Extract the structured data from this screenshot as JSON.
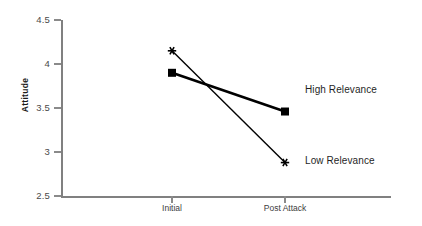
{
  "chart_data": {
    "type": "line",
    "title": "",
    "subtitle": "",
    "xlabel": "",
    "ylabel": "Attitude",
    "categories": [
      "Initial",
      "Post Attack"
    ],
    "ylim": [
      2.5,
      4.5
    ],
    "y_ticks": [
      2.5,
      3,
      3.5,
      4,
      4.5
    ],
    "y_tick_labels": [
      "2.5",
      "3",
      "3.5",
      "4",
      "4.5"
    ],
    "grid": false,
    "legend_position": "inline-right",
    "series": [
      {
        "name": "High Relevance",
        "values": [
          3.9,
          3.46
        ],
        "marker": "square",
        "color": "#000000",
        "line_width": 2.6
      },
      {
        "name": "Low Relevance",
        "values": [
          4.15,
          2.88
        ],
        "marker": "asterisk",
        "color": "#000000",
        "line_width": 1.4
      }
    ],
    "annotations": [
      {
        "text": "High Relevance",
        "series": "High Relevance"
      },
      {
        "text": "Low Relevance",
        "series": "Low Relevance"
      }
    ],
    "colors": {
      "axis": "#808080",
      "tick_label": "#4a4a4a",
      "series_line": "#000000",
      "background": "#ffffff"
    }
  }
}
